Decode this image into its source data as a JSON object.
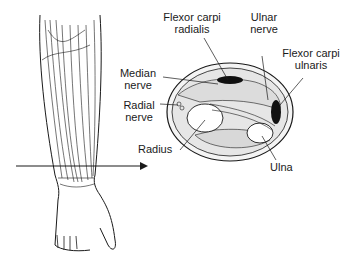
{
  "figure": {
    "labels": {
      "flexor_carpi_radialis": [
        "Flexor carpi",
        "radialis"
      ],
      "ulnar_nerve": [
        "Ulnar",
        "nerve"
      ],
      "median_nerve": [
        "Median",
        "nerve"
      ],
      "flexor_carpi_ulnaris": [
        "Flexor carpi",
        "ulnaris"
      ],
      "radial_nerve": [
        "Radial",
        "nerve"
      ],
      "radius": "Radius",
      "ulna": "Ulna"
    },
    "colors": {
      "line": "#1a1a1a",
      "fill_dark": "#111111",
      "bone": "#ffffff",
      "muscle": "#e8e8e8"
    }
  }
}
